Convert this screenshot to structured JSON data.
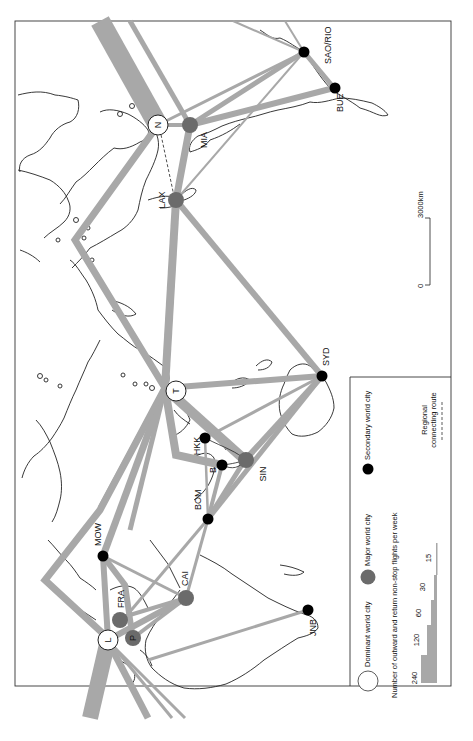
{
  "map": {
    "title": "World city air-route network",
    "orientation": "rotated 90 degrees clockwise",
    "colors": {
      "route": "#a8a8a8",
      "dominant_city_fill": "#ffffff",
      "major_city_fill": "#6b6b6b",
      "secondary_city_fill": "#000000",
      "coastline": "#222222",
      "frame": "#333333"
    },
    "cities": [
      {
        "code": "L",
        "type": "dominant"
      },
      {
        "code": "N",
        "type": "dominant"
      },
      {
        "code": "T",
        "type": "dominant"
      },
      {
        "code": "P",
        "type": "major"
      },
      {
        "code": "FRA",
        "type": "major"
      },
      {
        "code": "CAI",
        "type": "major"
      },
      {
        "code": "SIN",
        "type": "major"
      },
      {
        "code": "LAX",
        "type": "major"
      },
      {
        "code": "MIA",
        "type": "major"
      },
      {
        "code": "MOW",
        "type": "secondary"
      },
      {
        "code": "BOM",
        "type": "secondary"
      },
      {
        "code": "HKK",
        "type": "secondary"
      },
      {
        "code": "B",
        "type": "secondary"
      },
      {
        "code": "SYD",
        "type": "secondary"
      },
      {
        "code": "JNB",
        "type": "secondary"
      },
      {
        "code": "SAO/RIO",
        "type": "secondary"
      },
      {
        "code": "BUE",
        "type": "secondary"
      }
    ],
    "scale_bar": {
      "start": "0",
      "end": "3000km"
    }
  },
  "legend": {
    "dominant": "Dominant world city",
    "major": "Major world city",
    "secondary": "Secondary world city",
    "flights_title": "Number of outward and return non-stop flights per week",
    "flight_steps": [
      "240",
      "120",
      "60",
      "30",
      "15"
    ],
    "regional_line1": "Regional",
    "regional_line2": "connecting route"
  }
}
